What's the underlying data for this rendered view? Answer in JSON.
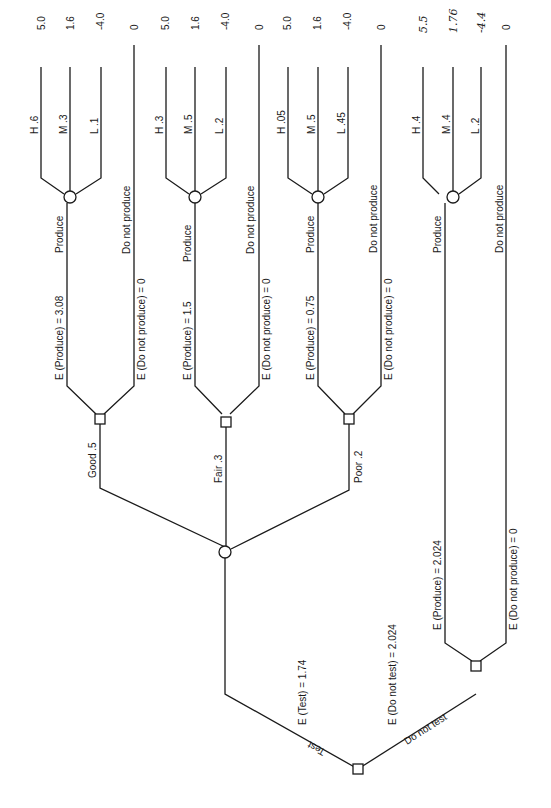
{
  "diagram": {
    "type": "decision-tree",
    "orientation": "rotated 90deg counter-clockwise (root at bottom, payoffs at top)",
    "root": {
      "type": "decision",
      "branches": [
        {
          "label": "Test",
          "expected_value_label": "E (Test) = 1.74",
          "child": {
            "type": "chance",
            "branches": [
              {
                "label": "Good .5",
                "decision": {
                  "produce_label": "Produce",
                  "produce_ev_label": "E (Produce) = 3.08",
                  "dont_label": "Do not produce",
                  "dont_ev_label": "E (Do not produce) = 0",
                  "dont_payoff": "0",
                  "outcomes": [
                    {
                      "label": "H .6",
                      "payoff": "5.0"
                    },
                    {
                      "label": "M .3",
                      "payoff": "1.6"
                    },
                    {
                      "label": "L .1",
                      "payoff": "-4.0"
                    }
                  ]
                }
              },
              {
                "label": "Fair .3",
                "decision": {
                  "produce_label": "Produce",
                  "produce_ev_label": "E (Produce) = 1.5",
                  "dont_label": "Do not produce",
                  "dont_ev_label": "E (Do not produce) = 0",
                  "dont_payoff": "0",
                  "outcomes": [
                    {
                      "label": "H .3",
                      "payoff": "5.0"
                    },
                    {
                      "label": "M .5",
                      "payoff": "1.6"
                    },
                    {
                      "label": "L .2",
                      "payoff": "-4.0"
                    }
                  ]
                }
              },
              {
                "label": "Poor .2",
                "decision": {
                  "produce_label": "Produce",
                  "produce_ev_label": "E (Produce) = 0.75",
                  "dont_label": "Do not produce",
                  "dont_ev_label": "E (Do not produce) = 0",
                  "dont_payoff": "0",
                  "outcomes": [
                    {
                      "label": "H .05",
                      "payoff": "5.0"
                    },
                    {
                      "label": "M .5",
                      "payoff": "1.6"
                    },
                    {
                      "label": "L .45",
                      "payoff": "-4.0"
                    }
                  ]
                }
              }
            ]
          }
        },
        {
          "label": "Do not test",
          "expected_value_label": "E (Do not test) = 2.024",
          "decision": {
            "produce_label": "Produce",
            "produce_ev_label": "E (Produce) = 2.024",
            "dont_label": "Do not produce",
            "dont_ev_label": "E (Do not produce) = 0",
            "dont_payoff": "0",
            "outcomes": [
              {
                "label": "H .4",
                "payoff": "5.5",
                "handwritten": true
              },
              {
                "label": "M .4",
                "payoff": "1.76",
                "handwritten": true
              },
              {
                "label": "L .2",
                "payoff": "-4.4",
                "handwritten": true
              }
            ]
          }
        }
      ]
    }
  }
}
